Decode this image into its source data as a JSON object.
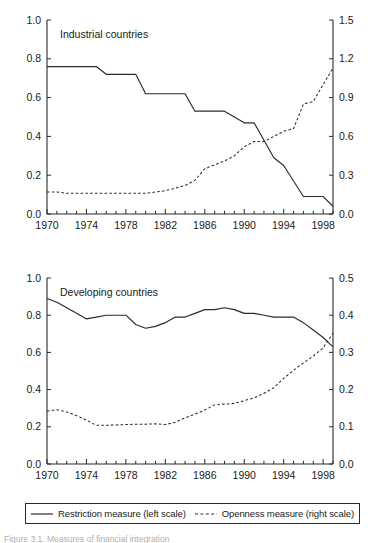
{
  "figure": {
    "caption": "Figure 3.1. Measures of financial integration",
    "background": "#ffffff",
    "line_color": "#2a2a2a"
  },
  "legend": {
    "items": [
      {
        "label": "Restriction measure (left scale)",
        "style": "solid",
        "icon": "solid-line-icon"
      },
      {
        "label": "Openness measure (right scale)",
        "style": "dashed",
        "icon": "dashed-line-icon"
      }
    ]
  },
  "chart_data": [
    {
      "type": "line",
      "title": "Industrial countries",
      "panel": "top",
      "xlabel": "",
      "ylabel": "",
      "grid": false,
      "legend_position": "below-figure",
      "x": [
        1970,
        1971,
        1972,
        1973,
        1974,
        1975,
        1976,
        1977,
        1978,
        1979,
        1980,
        1981,
        1982,
        1983,
        1984,
        1985,
        1986,
        1987,
        1988,
        1989,
        1990,
        1991,
        1992,
        1993,
        1994,
        1995,
        1996,
        1997,
        1998,
        1999
      ],
      "xlim": [
        1970,
        1999
      ],
      "xticks": [
        1970,
        1974,
        1978,
        1982,
        1986,
        1990,
        1994,
        1998
      ],
      "xticklabels": [
        "1970",
        "1974",
        "1978",
        "1982",
        "1986",
        "1990",
        "1994",
        "1998"
      ],
      "left_axis": {
        "ylim": [
          0.0,
          1.0
        ],
        "yticks": [
          0.0,
          0.2,
          0.4,
          0.6,
          0.8,
          1.0
        ],
        "yticklabels": [
          "0.0",
          "0.2",
          "0.4",
          "0.6",
          "0.8",
          "1.0"
        ]
      },
      "right_axis": {
        "ylim": [
          0.0,
          1.5
        ],
        "yticks": [
          0.0,
          0.3,
          0.6,
          0.9,
          1.2,
          1.5
        ],
        "yticklabels": [
          "0.0",
          "0.3",
          "0.6",
          "0.9",
          "1.2",
          "1.5"
        ]
      },
      "series": [
        {
          "name": "Restriction measure (left scale)",
          "axis": "left",
          "style": "solid",
          "values": [
            0.76,
            0.76,
            0.76,
            0.76,
            0.76,
            0.76,
            0.72,
            0.72,
            0.72,
            0.72,
            0.62,
            0.62,
            0.62,
            0.62,
            0.62,
            0.53,
            0.53,
            0.53,
            0.53,
            0.5,
            0.47,
            0.47,
            0.38,
            0.29,
            0.25,
            0.17,
            0.09,
            0.09,
            0.09,
            0.04
          ]
        },
        {
          "name": "Openness measure (right scale)",
          "axis": "right",
          "style": "dashed",
          "values": [
            0.17,
            0.17,
            0.16,
            0.16,
            0.16,
            0.16,
            0.16,
            0.16,
            0.16,
            0.16,
            0.16,
            0.17,
            0.18,
            0.2,
            0.22,
            0.26,
            0.35,
            0.38,
            0.41,
            0.45,
            0.52,
            0.56,
            0.56,
            0.6,
            0.64,
            0.66,
            0.85,
            0.87,
            1.0,
            1.13,
            1.49
          ]
        }
      ]
    },
    {
      "type": "line",
      "title": "Developing countries",
      "panel": "bottom",
      "xlabel": "",
      "ylabel": "",
      "grid": false,
      "legend_position": "below-figure",
      "x": [
        1970,
        1971,
        1972,
        1973,
        1974,
        1975,
        1976,
        1977,
        1978,
        1979,
        1980,
        1981,
        1982,
        1983,
        1984,
        1985,
        1986,
        1987,
        1988,
        1989,
        1990,
        1991,
        1992,
        1993,
        1994,
        1995,
        1996,
        1997,
        1998,
        1999
      ],
      "xlim": [
        1970,
        1999
      ],
      "xticks": [
        1970,
        1974,
        1978,
        1982,
        1986,
        1990,
        1994,
        1998
      ],
      "xticklabels": [
        "1970",
        "1974",
        "1978",
        "1982",
        "1986",
        "1990",
        "1994",
        "1998"
      ],
      "left_axis": {
        "ylim": [
          0.0,
          1.0
        ],
        "yticks": [
          0.0,
          0.2,
          0.4,
          0.6,
          0.8,
          1.0
        ],
        "yticklabels": [
          "0.0",
          "0.2",
          "0.4",
          "0.6",
          "0.8",
          "1.0"
        ]
      },
      "right_axis": {
        "ylim": [
          0.0,
          0.5
        ],
        "yticks": [
          0.0,
          0.1,
          0.2,
          0.3,
          0.4,
          0.5
        ],
        "yticklabels": [
          "0.0",
          "0.1",
          "0.2",
          "0.3",
          "0.4",
          "0.5"
        ]
      },
      "series": [
        {
          "name": "Restriction measure (left scale)",
          "axis": "left",
          "style": "solid",
          "values": [
            0.89,
            0.87,
            0.84,
            0.81,
            0.78,
            0.79,
            0.8,
            0.8,
            0.8,
            0.75,
            0.73,
            0.74,
            0.76,
            0.79,
            0.79,
            0.81,
            0.83,
            0.83,
            0.84,
            0.83,
            0.81,
            0.81,
            0.8,
            0.79,
            0.79,
            0.79,
            0.76,
            0.72,
            0.68,
            0.63
          ]
        },
        {
          "name": "Openness measure (right scale)",
          "axis": "right",
          "style": "dashed",
          "values": [
            0.142,
            0.146,
            0.14,
            0.13,
            0.118,
            0.104,
            0.104,
            0.105,
            0.106,
            0.107,
            0.107,
            0.108,
            0.106,
            0.112,
            0.124,
            0.134,
            0.145,
            0.159,
            0.161,
            0.163,
            0.17,
            0.178,
            0.19,
            0.205,
            0.23,
            0.252,
            0.272,
            0.29,
            0.312,
            0.352
          ]
        }
      ]
    }
  ]
}
